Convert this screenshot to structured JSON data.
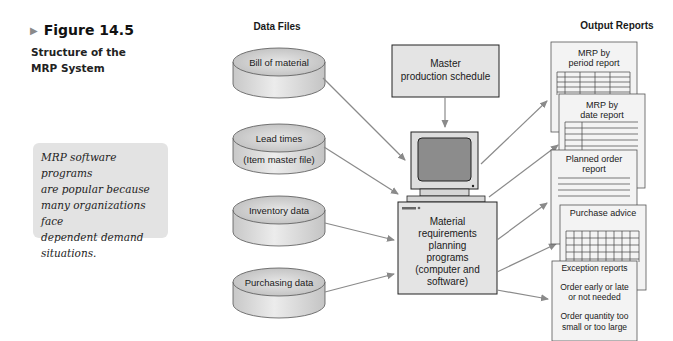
{
  "figure": {
    "number_label": "Figure 14.5",
    "caption_line1": "Structure of the",
    "caption_line2": "MRP System"
  },
  "side_note": {
    "lines": [
      "MRP software programs",
      "are popular because",
      "many organizations face",
      "dependent demand",
      "situations."
    ]
  },
  "diagram": {
    "data_files_header": "Data Files",
    "output_reports_header": "Output Reports",
    "data_files": [
      {
        "label": "Bill of material"
      },
      {
        "label": "Lead times",
        "label2": "(Item master file)"
      },
      {
        "label": "Inventory data"
      },
      {
        "label": "Purchasing data"
      }
    ],
    "master_schedule": {
      "line1": "Master",
      "line2": "production schedule"
    },
    "processor": {
      "lines": [
        "Material",
        "requirements",
        "planning",
        "programs",
        "(computer and",
        "software)"
      ]
    },
    "reports": [
      {
        "line1": "MRP by",
        "line2": "period report"
      },
      {
        "line1": "MRP by",
        "line2": "date report"
      },
      {
        "line1": "Planned order",
        "line2": "report"
      },
      {
        "line1": "Purchase advice"
      },
      {
        "line1": "Exception reports",
        "item1_a": "Order early or late",
        "item1_b": "or not needed",
        "item2_a": "Order quantity too",
        "item2_b": "small or too large"
      }
    ],
    "colors": {
      "cylinder_top": "#cfcfcf",
      "cylinder_side": "#e2e2e2",
      "box_fill": "#e4e4e4",
      "screen": "#8c8c8c",
      "arrow": "#8a8a8a",
      "page_fill": "#f3f3f3"
    }
  }
}
